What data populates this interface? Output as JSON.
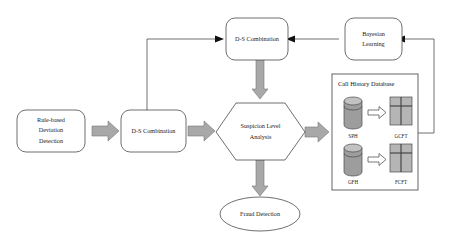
{
  "diagram": {
    "colors": {
      "arrow_fill": "#a8a8a8",
      "arrow_stroke": "#777777",
      "shape_stroke": "#4a4a4a",
      "cylinder_body": "#9d9d9d",
      "cylinder_top": "#c2c2c2",
      "table_cell": "#b5b5b5",
      "background": "#ffffff",
      "text": "#1a1a1a"
    },
    "nodes": {
      "rule_based": {
        "line1": "Rule-based",
        "line2": "Deviation",
        "line3": "Detection",
        "shape": "rounded-rectangle"
      },
      "ds_combination_lower": {
        "label": "D-S Combination",
        "shape": "rounded-rectangle"
      },
      "ds_combination_upper": {
        "label": "D-S Combination",
        "shape": "rounded-rectangle"
      },
      "bayesian_learning": {
        "line1": "Bayesian",
        "line2": "Learning",
        "shape": "rounded-rectangle"
      },
      "suspicion_level": {
        "line1": "Suspicion Level",
        "line2": "Analysis",
        "shape": "hexagon"
      },
      "fraud_detection": {
        "label": "Fraud Detection",
        "shape": "ellipse"
      }
    },
    "database_panel": {
      "title": "Call History Database",
      "rows": [
        {
          "store_label": "SPH",
          "table_label": "GCFT"
        },
        {
          "store_label": "GFH",
          "table_label": "FCFT"
        }
      ]
    },
    "icons": {
      "block_arrow": "block-arrow-icon",
      "hollow_arrow": "hollow-arrow-icon",
      "cylinder": "database-cylinder-icon",
      "grid_table": "grid-table-icon",
      "line_arrowhead": "arrowhead-icon"
    }
  }
}
